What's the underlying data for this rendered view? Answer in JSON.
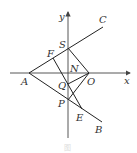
{
  "diagram": {
    "axes": {
      "x_label": "x",
      "y_label": "y"
    },
    "points": {
      "A": {
        "label": "A",
        "x": 29,
        "y": 73
      },
      "O": {
        "label": "O",
        "x": 89,
        "y": 73
      },
      "S": {
        "label": "S",
        "x": 68,
        "y": 48
      },
      "F": {
        "label": "F",
        "x": 53,
        "y": 58
      },
      "N": {
        "label": "N",
        "x": 68,
        "y": 73
      },
      "Q": {
        "label": "Q",
        "x": 68,
        "y": 84
      },
      "P": {
        "label": "P",
        "x": 68,
        "y": 100
      },
      "E": {
        "label": "E",
        "x": 82,
        "y": 109
      },
      "C": {
        "label": "C",
        "x": 103,
        "y": 27
      },
      "B": {
        "label": "B",
        "x": 102,
        "y": 122
      }
    },
    "segments": [
      "A-C",
      "A-B",
      "S-O",
      "F-E",
      "Q-O",
      "P-O",
      "A-Q"
    ],
    "caption": "图"
  }
}
